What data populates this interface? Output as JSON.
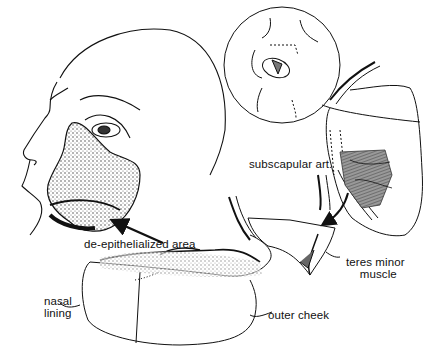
{
  "figure": {
    "labels": {
      "deepithelialized": "de-epithelialized area",
      "subscapular": "subscapular art.",
      "teres_line1": "teres minor",
      "teres_line2": "muscle",
      "nasal_line1": "nasal",
      "nasal_line2": "lining",
      "outer_cheek": "outer cheek"
    },
    "panels": [
      {
        "name": "head-with-cheek-defect"
      },
      {
        "name": "inset-circle-back-view"
      },
      {
        "name": "scapular-flap-harvest"
      },
      {
        "name": "folded-flap-with-pedicle"
      }
    ],
    "colors": {
      "ink": "#111111",
      "shade": "#555555",
      "muscle": "#777777",
      "background": "#ffffff"
    }
  }
}
